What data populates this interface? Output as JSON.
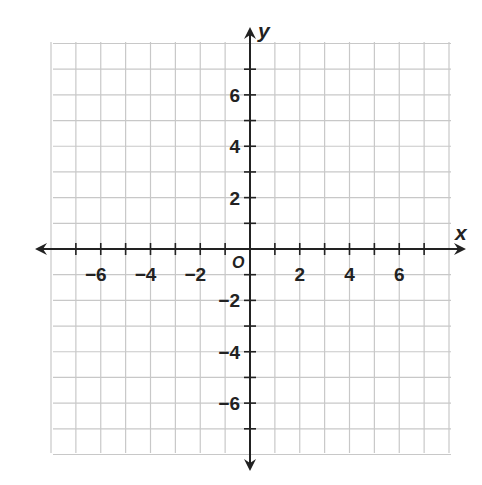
{
  "chart_data": {
    "type": "scatter",
    "title": "",
    "xlabel": "x",
    "ylabel": "y",
    "origin_label": "O",
    "xlim": [
      -8,
      8
    ],
    "ylim": [
      -8,
      8
    ],
    "grid": true,
    "grid_step": 1,
    "x_ticks": [
      -7,
      -6,
      -5,
      -4,
      -3,
      -2,
      -1,
      1,
      2,
      3,
      4,
      5,
      6,
      7
    ],
    "y_ticks": [
      -7,
      -6,
      -5,
      -4,
      -3,
      -2,
      -1,
      1,
      2,
      3,
      4,
      5,
      6,
      7
    ],
    "x_tick_labels": [
      {
        "value": -6,
        "label": "−6"
      },
      {
        "value": -4,
        "label": "−4"
      },
      {
        "value": -2,
        "label": "−2"
      },
      {
        "value": 2,
        "label": "2"
      },
      {
        "value": 4,
        "label": "4"
      },
      {
        "value": 6,
        "label": "6"
      }
    ],
    "y_tick_labels": [
      {
        "value": 6,
        "label": "6"
      },
      {
        "value": 4,
        "label": "4"
      },
      {
        "value": 2,
        "label": "2"
      },
      {
        "value": -2,
        "label": "−2"
      },
      {
        "value": -4,
        "label": "−4"
      },
      {
        "value": -6,
        "label": "−6"
      }
    ],
    "series": [],
    "colors": {
      "grid": "#c8c8c8",
      "axis": "#222222",
      "background": "#ffffff"
    }
  },
  "layout": {
    "grid_left": 53,
    "grid_right": 451,
    "grid_top": 42,
    "grid_bottom": 453,
    "origin_x": 250,
    "origin_y": 249,
    "x_arrow_left": 35,
    "x_arrow_right": 466,
    "y_arrow_top": 27,
    "y_arrow_bottom": 471
  }
}
